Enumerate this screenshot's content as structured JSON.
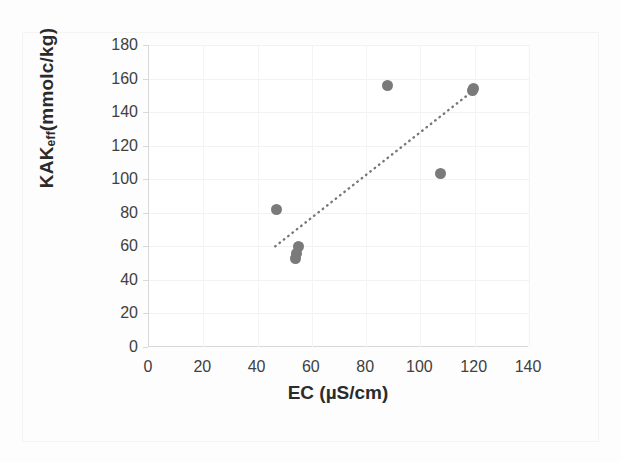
{
  "chart_data": {
    "type": "scatter",
    "title": "",
    "xlabel": "EC (µS/cm)",
    "ylabel_main": "KAK",
    "ylabel_sub": "eff",
    "ylabel_tail": " (mmolc/kg)",
    "ylabel": "KAKeff (mmolc/kg)",
    "xlim": [
      0,
      140
    ],
    "ylim": [
      0,
      180
    ],
    "x_ticks": [
      0,
      20,
      40,
      60,
      80,
      100,
      120,
      140
    ],
    "y_ticks": [
      0,
      20,
      40,
      60,
      80,
      100,
      120,
      140,
      160,
      180
    ],
    "x_tick_labels": [
      "0",
      "20",
      "40",
      "60",
      "80",
      "100",
      "120",
      "140"
    ],
    "y_tick_labels": [
      "0",
      "20",
      "40",
      "60",
      "80",
      "100",
      "120",
      "140",
      "160",
      "180"
    ],
    "grid": true,
    "legend": "none",
    "marker_color": "#7a7a7a",
    "marker_size": 11,
    "points": [
      {
        "x": 47,
        "y": 82
      },
      {
        "x": 54,
        "y": 53
      },
      {
        "x": 54.5,
        "y": 56
      },
      {
        "x": 55,
        "y": 60
      },
      {
        "x": 88,
        "y": 156
      },
      {
        "x": 107.5,
        "y": 103.5
      },
      {
        "x": 119,
        "y": 153
      },
      {
        "x": 119.5,
        "y": 154
      }
    ],
    "trendline": {
      "style": "dotted",
      "color": "#777777",
      "x_start": 46.5,
      "y_start": 60,
      "x_end": 120,
      "y_end": 153.5
    }
  },
  "axes": {
    "y_title_prefix": "KAK",
    "y_title_subscript": "eff",
    "y_title_suffix": " (mmolc/kg)",
    "x_title": "EC (µS/cm)"
  }
}
